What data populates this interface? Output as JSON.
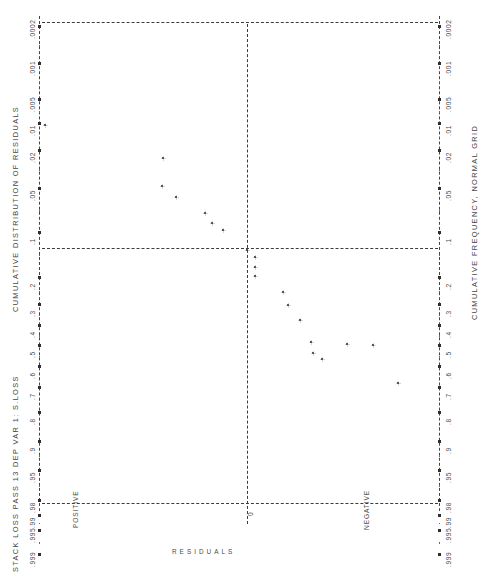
{
  "header": {
    "left_title": "STACK LOSS PASS 13  DEP VAR 1: S.LOSS",
    "left_axis_title": "CUMULATIVE DISTRIBUTION OF RESIDUALS",
    "right_axis_title": "CUMULATIVE FREQUENCY, NORMAL GRID",
    "bottom_axis_title": "RESIDUALS",
    "region_positive": "POSITIVE",
    "region_zero": "0",
    "region_negative": "NEGATIVE"
  },
  "chart_data": {
    "type": "scatter",
    "title": "STACK LOSS PASS 13  DEP VAR 1: S.LOSS",
    "xlabel": "RESIDUALS",
    "ylabel": "CUMULATIVE DISTRIBUTION OF RESIDUALS",
    "ylabel_right": "CUMULATIVE FREQUENCY, NORMAL GRID",
    "orientation": "rotated-90",
    "grid": "normal-probability",
    "axis_ticks": [
      ".0002",
      ".001",
      ".005",
      ".01",
      ".02",
      ".05",
      ".1",
      ".2",
      ".3",
      ".4",
      ".5",
      ".6",
      ".7",
      ".8",
      ".9",
      ".95",
      ".98",
      ".99",
      ".995",
      ".999"
    ],
    "x_region_labels": [
      "POSITIVE",
      "0",
      "NEGATIVE"
    ],
    "reference_lines": [
      {
        "name": "median-line",
        "value": 0.5,
        "style": "dashed"
      },
      {
        "name": "upper-frame",
        "value": 0.999,
        "style": "dashed"
      },
      {
        "name": "lower-frame",
        "value": 0.0002,
        "style": "dashed"
      },
      {
        "name": "zero-residual-line",
        "value": 0,
        "style": "dashed",
        "axis": "residual"
      }
    ],
    "points": [
      {
        "cum_freq": 0.952,
        "residual": 7.15,
        "label": "p1"
      },
      {
        "cum_freq": 0.905,
        "residual": 2.65,
        "label": "p2"
      },
      {
        "cum_freq": 0.857,
        "residual": 2.3,
        "label": "p3"
      },
      {
        "cum_freq": 0.81,
        "residual": 1.9,
        "label": "p4"
      },
      {
        "cum_freq": 0.762,
        "residual": 1.2,
        "label": "p5"
      },
      {
        "cum_freq": 0.714,
        "residual": 0.95,
        "label": "p6"
      },
      {
        "cum_freq": 0.667,
        "residual": 0.65,
        "label": "p7"
      },
      {
        "cum_freq": 0.619,
        "residual": 0.1,
        "label": "p8"
      },
      {
        "cum_freq": 0.571,
        "residual": -0.25,
        "label": "p9"
      },
      {
        "cum_freq": 0.524,
        "residual": -0.4,
        "label": "p10"
      },
      {
        "cum_freq": 0.476,
        "residual": -0.55,
        "label": "p11"
      },
      {
        "cum_freq": 0.429,
        "residual": -1.55,
        "label": "p12"
      },
      {
        "cum_freq": 0.381,
        "residual": -1.8,
        "label": "p13"
      },
      {
        "cum_freq": 0.333,
        "residual": -2.15,
        "label": "p14"
      },
      {
        "cum_freq": 0.286,
        "residual": -3.55,
        "label": "p15"
      },
      {
        "cum_freq": 0.238,
        "residual": -3.8,
        "label": "p16"
      },
      {
        "cum_freq": 0.19,
        "residual": -4.1,
        "label": "p17"
      },
      {
        "cum_freq": 0.143,
        "residual": -5.3,
        "label": "p18"
      },
      {
        "cum_freq": 0.095,
        "residual": -6.35,
        "label": "p19"
      },
      {
        "cum_freq": 0.048,
        "residual": -7.25,
        "label": "p20"
      }
    ]
  },
  "geometry": {
    "axis_left_x": 39,
    "axis_right_x": 439,
    "plot_top_y": 22,
    "plot_bottom_y": 503,
    "zero_line_x": 247,
    "median_line_y": 248,
    "tick_px": [
      26,
      63,
      99,
      123,
      150,
      188,
      232,
      277,
      304,
      325,
      345,
      366,
      387,
      412,
      441,
      470,
      500,
      515,
      530,
      554
    ],
    "point_px": [
      [
        45,
        125
      ],
      [
        163,
        158
      ],
      [
        162,
        186
      ],
      [
        176,
        197
      ],
      [
        205,
        213
      ],
      [
        212,
        223
      ],
      [
        223,
        230
      ],
      [
        247,
        250
      ],
      [
        255,
        257
      ],
      [
        255,
        267
      ],
      [
        255,
        276
      ],
      [
        283,
        292
      ],
      [
        288,
        305
      ],
      [
        300,
        320
      ],
      [
        311,
        342
      ],
      [
        313,
        353
      ],
      [
        322,
        359
      ],
      [
        347,
        344
      ],
      [
        373,
        345
      ],
      [
        398,
        383
      ]
    ]
  }
}
